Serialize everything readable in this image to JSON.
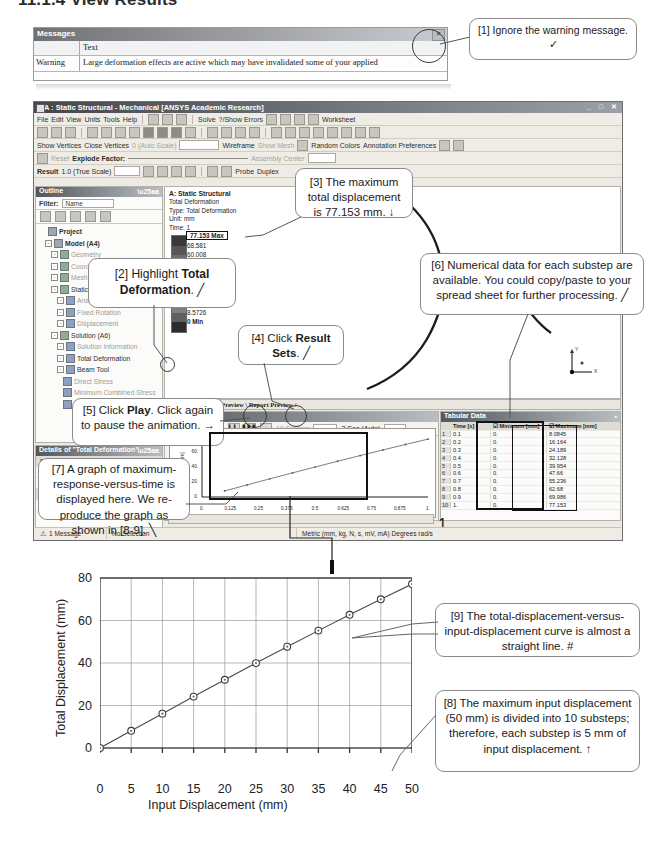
{
  "page": {
    "heading": "11.1.4  View Results"
  },
  "messages": {
    "panel_title": "Messages",
    "close_icon": "×",
    "columns": [
      "",
      "Text"
    ],
    "rows": [
      {
        "type": "Warning",
        "text": "Large deformation effects are active which may have invalidated some of your applied"
      }
    ]
  },
  "ansys": {
    "title": "A : Static Structural - Mechanical [ANSYS Academic Research]",
    "window_buttons": "_ □ ✕",
    "menus": [
      "File",
      "Edit",
      "View",
      "Units",
      "Tools",
      "Help"
    ],
    "toolbar1": [
      "Solve",
      "?/Show Errors",
      "Worksheet"
    ],
    "toolbar3": [
      "Show Vertices",
      "Close Vertices",
      "0 (Auto Scale)",
      "Wireframe",
      "Show Mesh",
      "Random Colors",
      "Annotation Preferences"
    ],
    "toolbar4": [
      "Reset",
      "Explode Factor:",
      "Assembly Center"
    ],
    "toolbar5": [
      "Result",
      "1.0 (True Scale)",
      "Probe",
      "Duplex"
    ],
    "outline": {
      "panel_title": "Outline",
      "filter_label": "Filter:",
      "filter_value": "Name",
      "tree": [
        {
          "label": "Project",
          "depth": 0,
          "icon": "project-icon"
        },
        {
          "label": "Model (A4)",
          "depth": 1,
          "icon": "model-icon"
        },
        {
          "label": "Geometry",
          "depth": 2,
          "icon": "geometry-icon"
        },
        {
          "label": "Coordinate Systems",
          "depth": 2,
          "icon": "coordinate-icon"
        },
        {
          "label": "Mesh",
          "depth": 2,
          "icon": "mesh-icon"
        },
        {
          "label": "Static Structural (A5)",
          "depth": 2,
          "icon": "analysis-icon"
        },
        {
          "label": "Analysis Settings",
          "depth": 3,
          "icon": "settings-icon"
        },
        {
          "label": "Fixed Rotation",
          "depth": 3,
          "icon": "support-icon"
        },
        {
          "label": "Displacement",
          "depth": 3,
          "icon": "displacement-icon"
        },
        {
          "label": "Solution (A6)",
          "depth": 2,
          "icon": "solution-icon"
        },
        {
          "label": "Solution Information",
          "depth": 3,
          "icon": "info-icon"
        },
        {
          "label": "Total Deformation",
          "depth": 3,
          "icon": "result-icon"
        },
        {
          "label": "Beam Tool",
          "depth": 3,
          "icon": "beamtool-icon"
        },
        {
          "label": "Direct Stress",
          "depth": 4,
          "icon": "result-icon"
        },
        {
          "label": "Minimum Combined Stress",
          "depth": 4,
          "icon": "result-icon"
        },
        {
          "label": "Maximum Combined Stress",
          "depth": 4,
          "icon": "result-icon"
        }
      ]
    },
    "details": {
      "panel_title": "Details of \"Total Deformation\"",
      "rows": [
        {
          "key": "Scope",
          "value": "",
          "header": true
        },
        {
          "key": "Scoping Method",
          "value": "Geometry Selection",
          "header": false
        },
        {
          "key": "Geometry",
          "value": "All Bodies",
          "header": false
        },
        {
          "key": "Definition",
          "value": "",
          "header": true
        },
        {
          "key": "Type",
          "value": "Total Deformation",
          "header": false
        }
      ]
    },
    "viewport": {
      "header": [
        "A: Static Structural",
        "Total Deformation",
        "Type: Total Deformation",
        "Unit: mm",
        "Time: 1"
      ],
      "legend": [
        "77.153 Max",
        "68.581",
        "60.008",
        "51.436",
        "42.863",
        "34.29",
        "25.718",
        "17.145",
        "8.5726",
        "0 Min"
      ],
      "triad_labels": [
        "Y",
        "X"
      ],
      "tabs": "\\ Geometry \\ Print Preview \\ Report Preview /"
    },
    "graph": {
      "panel_title": "Graph",
      "buttons": [
        "play-button",
        "stop-button",
        "frame-step-button",
        "result-sets-button",
        "light-bulb-icon"
      ],
      "frames_value": "10 Frames",
      "duration_value": "2 Sec (Auto)",
      "yticks": [
        "77.153",
        "60.",
        "40.",
        "20.",
        "0."
      ],
      "xticks": [
        "0.",
        "0.125",
        "0.25",
        "0.375",
        "0.5",
        "0.625",
        "0.75",
        "0.875",
        "1."
      ],
      "ylabel": "[mm]",
      "xlabel": "[s]",
      "animation_value": "1"
    },
    "tabular": {
      "panel_title": "Tabular Data",
      "columns": [
        "",
        "Time [s]",
        "Minimum [mm]",
        "Maximum [mm]"
      ],
      "rows": [
        {
          "n": "1",
          "time": "0.1",
          "min": "0.",
          "max": "8.0845"
        },
        {
          "n": "2",
          "time": "0.2",
          "min": "0.",
          "max": "16.164"
        },
        {
          "n": "3",
          "time": "0.3",
          "min": "0.",
          "max": "24.189"
        },
        {
          "n": "4",
          "time": "0.4",
          "min": "0.",
          "max": "32.128"
        },
        {
          "n": "5",
          "time": "0.5",
          "min": "0.",
          "max": "39.954"
        },
        {
          "n": "6",
          "time": "0.6",
          "min": "0.",
          "max": "47.66"
        },
        {
          "n": "7",
          "time": "0.7",
          "min": "0.",
          "max": "55.236"
        },
        {
          "n": "8",
          "time": "0.8",
          "min": "0.",
          "max": "62.68"
        },
        {
          "n": "9",
          "time": "0.9",
          "min": "0.",
          "max": "69.986"
        },
        {
          "n": "10",
          "time": "1.",
          "min": "0.",
          "max": "77.153"
        }
      ]
    },
    "status_bar": [
      "1 Message",
      "No Selection",
      "Metric (mm, kg, N, s, mV, mA)   Degrees   rad/s"
    ]
  },
  "callouts": {
    "c1": {
      "id": "[1]",
      "text": "[1] Ignore the warning message.  ✓"
    },
    "c2": {
      "id": "[2]",
      "pre": "[2] Highlight ",
      "bold": "Total Deformation",
      "post": ".  ╱"
    },
    "c3": {
      "id": "[3]",
      "text": "[3] The maximum total displacement is 77.153 mm.  ↓"
    },
    "c4": {
      "id": "[4]",
      "pre": "[4] Click ",
      "bold": "Result Sets",
      "post": ".  ╱"
    },
    "c5": {
      "id": "[5]",
      "pre": "[5] Click ",
      "bold": "Play",
      "post": ". Click again to pause the animation.  →"
    },
    "c6": {
      "id": "[6]",
      "text": "[6] Numerical data for each substep are available. You could copy/paste to your spread sheet for further processing.  ╱"
    },
    "c7": {
      "id": "[7]",
      "text": "[7] A graph of maximum-response-versus-time is displayed here. We re-produce the graph as shown in [8-9].  ╲"
    },
    "c8": {
      "id": "[8]",
      "text": "[8] The maximum input displacement (50 mm) is divided into 10 substeps; therefore, each substep is 5 mm of input displacement.  ↑"
    },
    "c9": {
      "id": "[9]",
      "text": "[9] The total-displacement-versus-input-displacement curve is almost a straight line.  #"
    }
  },
  "chart_data": {
    "type": "line",
    "title": "",
    "xlabel": "Input Displacement (mm)",
    "ylabel": "Total Displacement (mm)",
    "xlim": [
      0,
      50
    ],
    "ylim": [
      0,
      80
    ],
    "xticks": [
      0,
      5,
      10,
      15,
      20,
      25,
      30,
      35,
      40,
      45,
      50
    ],
    "yticks": [
      0,
      20,
      40,
      60,
      80
    ],
    "grid": true,
    "legend": "none",
    "marker": "circle",
    "x": [
      0,
      5,
      10,
      15,
      20,
      25,
      30,
      35,
      40,
      45,
      50
    ],
    "y": [
      0,
      8.0845,
      16.164,
      24.189,
      32.128,
      39.954,
      47.66,
      55.236,
      62.68,
      69.986,
      77.153
    ],
    "series": [
      {
        "name": "Total Displacement",
        "values": [
          0,
          8.0845,
          16.164,
          24.189,
          32.128,
          39.954,
          47.66,
          55.236,
          62.68,
          69.986,
          77.153
        ]
      }
    ]
  }
}
